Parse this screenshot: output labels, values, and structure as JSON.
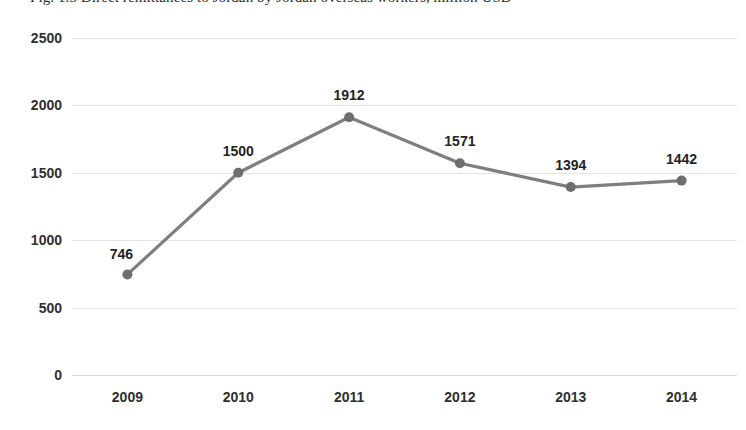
{
  "caption": {
    "text": "Fig. 1.3     Direct remittances to Jordan by Jordan overseas workers, million USD"
  },
  "chart_data": {
    "type": "line",
    "title": "",
    "xlabel": "",
    "ylabel": "",
    "categories": [
      "2009",
      "2010",
      "2011",
      "2012",
      "2013",
      "2014"
    ],
    "values": [
      746,
      1500,
      1912,
      1571,
      1394,
      1442
    ],
    "data_labels": [
      "746",
      "1500",
      "1912",
      "1571",
      "1394",
      "1442"
    ],
    "ylim": [
      0,
      2500
    ],
    "yticks": [
      0,
      500,
      1000,
      1500,
      2000,
      2500
    ],
    "ytick_labels": [
      "0",
      "500",
      "1000",
      "1500",
      "2000",
      "2500"
    ],
    "grid": true,
    "grid_axis": "y",
    "legend": false,
    "legend_position": "none",
    "series": [
      {
        "name": "",
        "values": [
          746,
          1500,
          1912,
          1571,
          1394,
          1442
        ],
        "color": "#7f7f7f",
        "marker": "circle",
        "line_width": 3
      }
    ],
    "colors": {
      "line": "#7f7f7f",
      "marker": "#6e6e6e",
      "grid": "#e4e4e4",
      "axis": "#dcdcdc",
      "text": "#2f2f2f",
      "background": "#ffffff"
    }
  }
}
